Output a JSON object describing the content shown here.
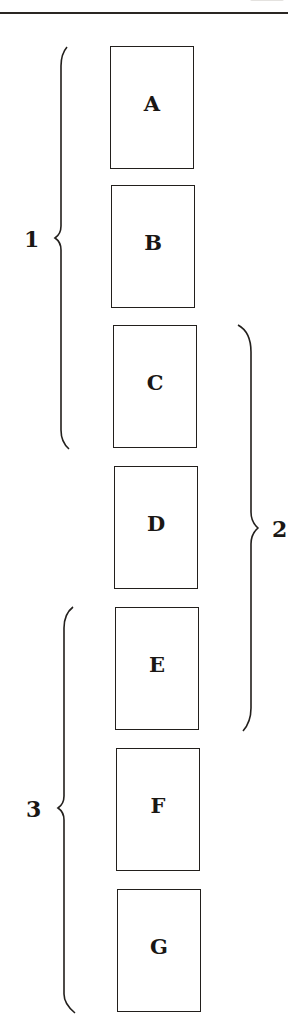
{
  "diagram": {
    "type": "grouped-sequence",
    "boxes": [
      {
        "label": "A",
        "x": 110,
        "y": 46
      },
      {
        "label": "B",
        "x": 111,
        "y": 185
      },
      {
        "label": "C",
        "x": 113,
        "y": 325
      },
      {
        "label": "D",
        "x": 114,
        "y": 466
      },
      {
        "label": "E",
        "x": 115,
        "y": 607
      },
      {
        "label": "F",
        "x": 116,
        "y": 748
      },
      {
        "label": "G",
        "x": 117,
        "y": 889
      }
    ],
    "groups": [
      {
        "label": "1",
        "side": "left",
        "members": [
          "A",
          "B",
          "C"
        ]
      },
      {
        "label": "2",
        "side": "right",
        "members": [
          "C",
          "D",
          "E"
        ]
      },
      {
        "label": "3",
        "side": "left",
        "members": [
          "E",
          "F",
          "G"
        ]
      }
    ],
    "stroke_color": "#221f1c",
    "background": "#ffffff"
  }
}
